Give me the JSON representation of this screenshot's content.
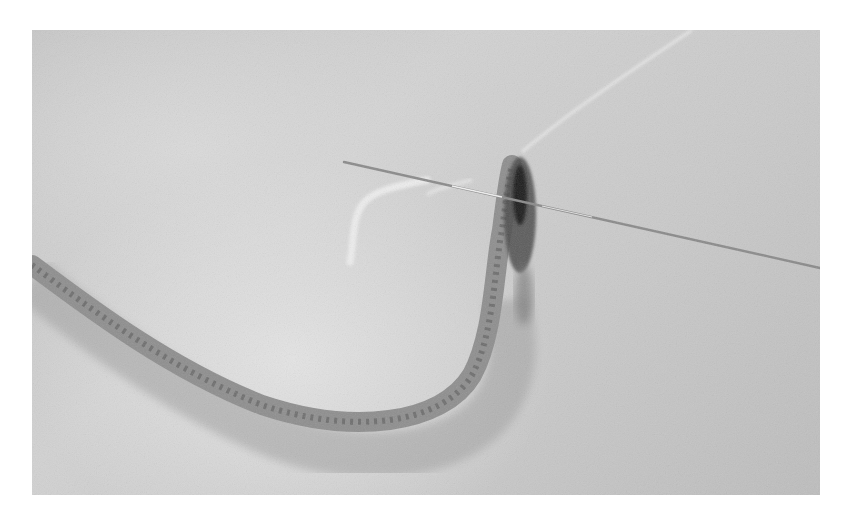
{
  "image": {
    "description": "Grayscale photo of a needle threaded through the end of a crocheted cord lying in a curve on light fabric",
    "colors": {
      "page_background": "#ffffff",
      "fabric": "#cacaca",
      "cord": "#8a8a8a",
      "cord_shadow": "#a8a8a8",
      "needle": "#9a9a9a",
      "thread": "#ececec"
    },
    "frame": {
      "left": 32,
      "top": 30,
      "width": 788,
      "height": 465
    }
  }
}
